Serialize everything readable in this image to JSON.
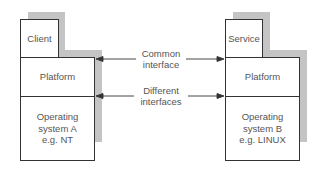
{
  "diagram": {
    "left_stack": {
      "top": "Client",
      "middle": "Platform",
      "bottom": [
        "Operating",
        "system A",
        "e.g. NT"
      ]
    },
    "right_stack": {
      "top": "Service",
      "middle": "Platform",
      "bottom": [
        "Operating",
        "system B",
        "e.g. LINUX"
      ]
    },
    "arrows": [
      {
        "label": [
          "Common",
          "interface"
        ],
        "direction": "bidirectional"
      },
      {
        "label": [
          "Different",
          "interfaces"
        ],
        "direction": "bidirectional"
      }
    ],
    "colors": {
      "shadow": "#c4c4c4",
      "border": "#333333",
      "text": "#555555"
    }
  }
}
